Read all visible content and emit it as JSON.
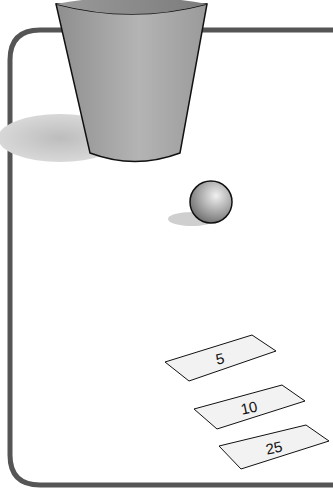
{
  "scene": {
    "description": "Cup toss game board: a cup, a ball, and three scoring targets",
    "targets": [
      {
        "label": "5"
      },
      {
        "label": "10"
      },
      {
        "label": "25"
      }
    ],
    "colors": {
      "border": "#555555",
      "cup": "#a8a8a8",
      "shadow": "#cfcfcf",
      "target_fill": "#f2f2f2"
    }
  }
}
